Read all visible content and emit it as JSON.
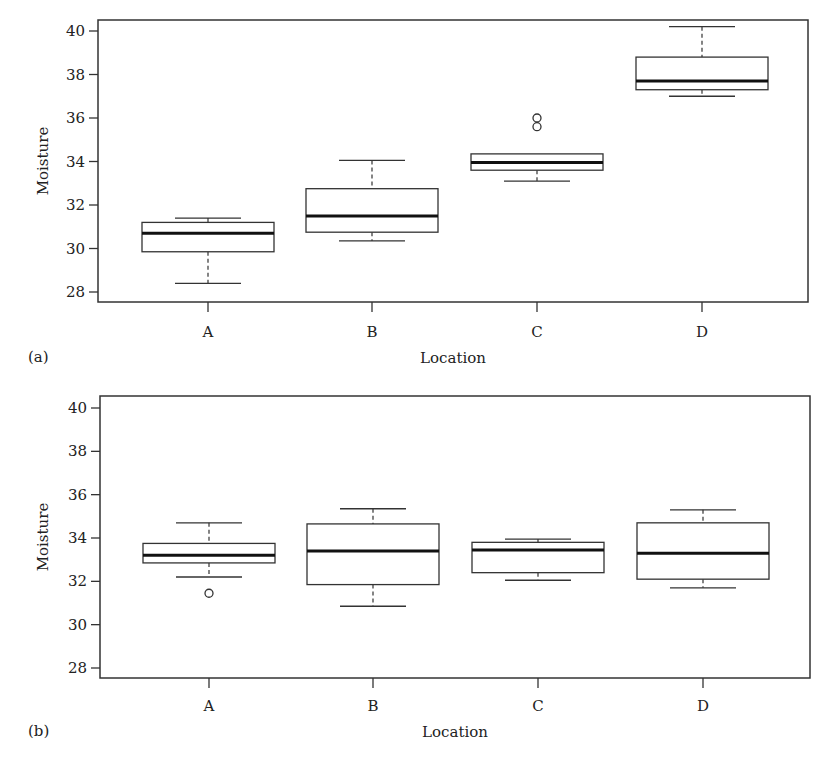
{
  "figure": {
    "panels": [
      {
        "label": "(a)",
        "xlabel": "Location",
        "ylabel": "Moisture",
        "yticks": [
          "28",
          "30",
          "32",
          "34",
          "36",
          "38",
          "40"
        ],
        "categories": [
          "A",
          "B",
          "C",
          "D"
        ]
      },
      {
        "label": "(b)",
        "xlabel": "Location",
        "ylabel": "Moisture",
        "yticks": [
          "28",
          "30",
          "32",
          "34",
          "36",
          "38",
          "40"
        ],
        "categories": [
          "A",
          "B",
          "C",
          "D"
        ]
      }
    ]
  },
  "chart_data": [
    {
      "type": "boxplot",
      "panel": "(a)",
      "title": "",
      "xlabel": "Location",
      "ylabel": "Moisture",
      "ylim": [
        27.5,
        40.5
      ],
      "yticks": [
        28,
        30,
        32,
        34,
        36,
        38,
        40
      ],
      "grid": false,
      "categories": [
        "A",
        "B",
        "C",
        "D"
      ],
      "boxes": [
        {
          "category": "A",
          "whisker_low": 28.4,
          "q1": 29.85,
          "median": 30.7,
          "q3": 31.2,
          "whisker_high": 31.4,
          "outliers": []
        },
        {
          "category": "B",
          "whisker_low": 30.35,
          "q1": 30.75,
          "median": 31.5,
          "q3": 32.75,
          "whisker_high": 34.05,
          "outliers": []
        },
        {
          "category": "C",
          "whisker_low": 33.1,
          "q1": 33.6,
          "median": 33.95,
          "q3": 34.35,
          "whisker_high": 34.35,
          "outliers": [
            35.6,
            36.0
          ]
        },
        {
          "category": "D",
          "whisker_low": 37.0,
          "q1": 37.3,
          "median": 37.7,
          "q3": 38.8,
          "whisker_high": 40.2,
          "outliers": []
        }
      ]
    },
    {
      "type": "boxplot",
      "panel": "(b)",
      "title": "",
      "xlabel": "Location",
      "ylabel": "Moisture",
      "ylim": [
        27.5,
        40.5
      ],
      "yticks": [
        28,
        30,
        32,
        34,
        36,
        38,
        40
      ],
      "grid": false,
      "categories": [
        "A",
        "B",
        "C",
        "D"
      ],
      "boxes": [
        {
          "category": "A",
          "whisker_low": 32.2,
          "q1": 32.85,
          "median": 33.2,
          "q3": 33.75,
          "whisker_high": 34.7,
          "outliers": [
            31.45
          ]
        },
        {
          "category": "B",
          "whisker_low": 30.85,
          "q1": 31.85,
          "median": 33.4,
          "q3": 34.65,
          "whisker_high": 35.35,
          "outliers": []
        },
        {
          "category": "C",
          "whisker_low": 32.05,
          "q1": 32.4,
          "median": 33.45,
          "q3": 33.8,
          "whisker_high": 33.95,
          "outliers": []
        },
        {
          "category": "D",
          "whisker_low": 31.7,
          "q1": 32.1,
          "median": 33.3,
          "q3": 34.7,
          "whisker_high": 35.3,
          "outliers": []
        }
      ]
    }
  ]
}
